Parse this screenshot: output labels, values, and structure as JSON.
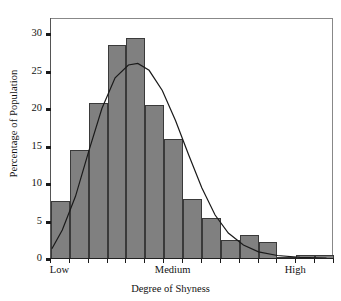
{
  "chart_data": {
    "type": "bar",
    "title": "",
    "xlabel": "Degree of Shyness",
    "ylabel": "Percentage of Population",
    "ylim": [
      0,
      32
    ],
    "yticks": [
      0,
      5,
      10,
      15,
      20,
      25,
      30
    ],
    "ytick_labels": [
      "0",
      "5",
      "10",
      "15",
      "20",
      "25",
      "30"
    ],
    "xtick_labels": [
      "Low",
      "Medium",
      "High"
    ],
    "xtick_label_positions": [
      0.5,
      6.5,
      13.0
    ],
    "grid": false,
    "legend": null,
    "bar_color": "#808080",
    "bar_edge_color": "#3a3a3a",
    "curve_color": "#1a1a1a",
    "categories": [
      "1",
      "2",
      "3",
      "4",
      "5",
      "6",
      "7",
      "8",
      "9",
      "10",
      "11",
      "12",
      "13",
      "14",
      "15"
    ],
    "values": [
      7.8,
      14.5,
      20.8,
      28.5,
      29.5,
      20.5,
      16.0,
      8.0,
      5.5,
      2.5,
      3.2,
      2.3,
      0.3,
      0.6,
      0.6
    ],
    "series": [
      {
        "name": "Percentage of Population",
        "type": "bar",
        "values": [
          7.8,
          14.5,
          20.8,
          28.5,
          29.5,
          20.5,
          16.0,
          8.0,
          5.5,
          2.5,
          3.2,
          2.3,
          0.3,
          0.6,
          0.6
        ]
      },
      {
        "name": "Normal curve overlay",
        "type": "line",
        "x": [
          0.05,
          0.6,
          1.3,
          2.0,
          2.7,
          3.4,
          4.1,
          4.6,
          5.2,
          5.9,
          6.6,
          7.3,
          8.0,
          8.7,
          9.4,
          10.2,
          11.0,
          12.0,
          13.2,
          14.6
        ],
        "values": [
          1.5,
          4.0,
          8.5,
          14.5,
          20.2,
          24.3,
          26.0,
          26.2,
          25.3,
          22.6,
          18.6,
          14.0,
          9.6,
          6.0,
          3.6,
          2.0,
          1.1,
          0.6,
          0.35,
          0.25
        ]
      }
    ]
  },
  "axes": {
    "ylabel": "Percentage of Population",
    "xlabel": "Degree of Shyness"
  }
}
